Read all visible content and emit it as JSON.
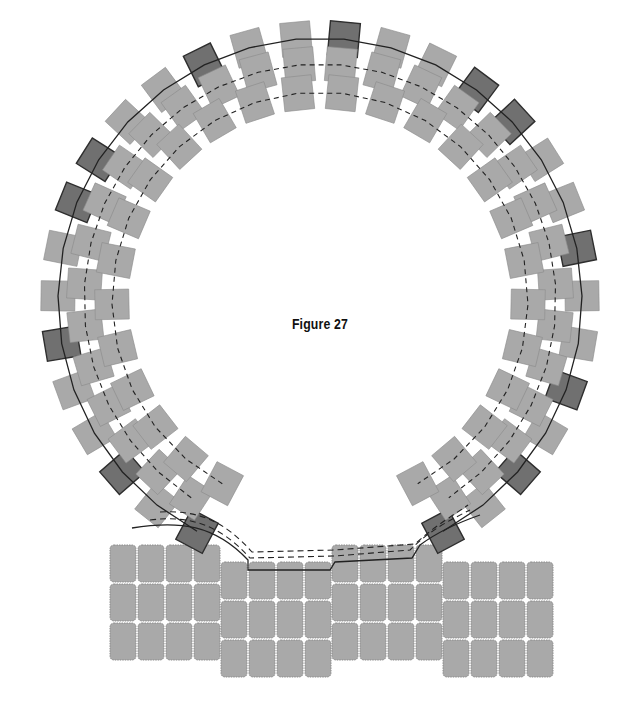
{
  "figure": {
    "caption": "Figure 27"
  },
  "colors": {
    "background": "#ffffff",
    "light_tile": "#a9a9a9",
    "light_tile_border": "#8c8c8c",
    "dark_tile": "#707070",
    "dark_tile_border": "#2e2e2e",
    "thread": "#222222"
  },
  "ring": {
    "center": [
      320,
      300
    ],
    "start_angle_deg": 118,
    "end_angle_deg": 422,
    "layers": [
      {
        "name": "outer",
        "radius": 262,
        "count": 30,
        "dark_pattern": [
          1,
          0,
          1,
          0,
          0,
          1,
          0,
          0,
          1,
          1,
          0,
          0,
          1,
          0,
          0,
          1,
          0,
          0,
          1,
          1,
          0,
          0,
          1,
          0,
          0,
          1,
          0,
          1,
          0,
          1
        ]
      },
      {
        "name": "middle",
        "radius": 236,
        "count": 30,
        "dark_pattern": []
      },
      {
        "name": "inner",
        "radius": 208,
        "count": 26,
        "dark_pattern": []
      }
    ],
    "tile_size": [
      30,
      34
    ]
  },
  "panels": [
    {
      "name": "panel-left",
      "x": 110,
      "y": 545,
      "cols": 4,
      "rows": 3
    },
    {
      "name": "panel-center-left",
      "x": 221,
      "y": 562,
      "cols": 4,
      "rows": 3
    },
    {
      "name": "panel-center-right",
      "x": 332,
      "y": 545,
      "cols": 4,
      "rows": 3
    },
    {
      "name": "panel-right",
      "x": 443,
      "y": 562,
      "cols": 4,
      "rows": 3
    }
  ],
  "panel_tile": {
    "w": 26,
    "h": 37,
    "gap": 2,
    "radius": 4
  }
}
